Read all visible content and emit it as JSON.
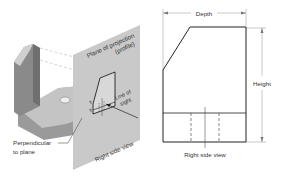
{
  "figure": {
    "left_pictorial": {
      "plane_label_line1": "Plane of projection",
      "plane_label_line2": "(profile)",
      "line_of_sight_line1": "Line of",
      "line_of_sight_line2": "sight",
      "perpendicular_line1": "Perpendicular",
      "perpendicular_line2": "to plane",
      "plane_view_label": "Right side view"
    },
    "right_orthographic": {
      "depth_label": "Depth",
      "height_label": "Height",
      "caption": "Right side view"
    }
  },
  "colors": {
    "plane_fill": "#c9c9c9",
    "object_dark": "#8a8a8a",
    "object_mid": "#a6a6a6",
    "object_light": "#d0d0d0",
    "line": "#222222",
    "dim_line": "#777777"
  }
}
